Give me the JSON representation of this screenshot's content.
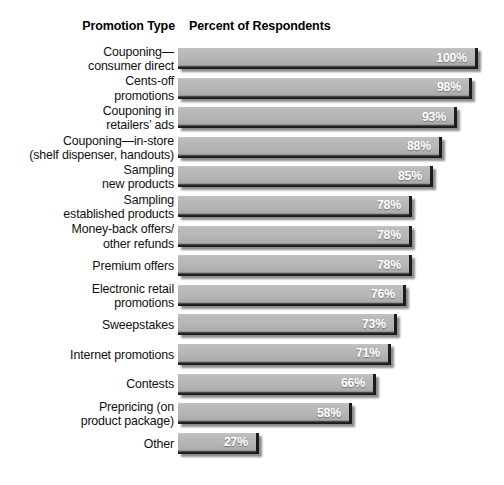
{
  "header": {
    "category_column": "Promotion Type",
    "value_column": "Percent of Respondents"
  },
  "watermark": "",
  "chart_data": {
    "type": "bar",
    "orientation": "horizontal",
    "title": "",
    "xlabel": "Percent of Respondents",
    "ylabel": "Promotion Type",
    "xlim": [
      0,
      100
    ],
    "grid": false,
    "legend": null,
    "value_suffix": "%",
    "bar_color": "#b4b4b4",
    "value_label_color": "#ffffff",
    "categories": [
      "Couponing—\nconsumer direct",
      "Cents-off\npromotions",
      "Couponing in\nretailers’ ads",
      "Couponing—in-store\n(shelf dispenser, handouts)",
      "Sampling\nnew products",
      "Sampling\nestablished products",
      "Money-back offers/\nother refunds",
      "Premium offers",
      "Electronic retail\npromotions",
      "Sweepstakes",
      "Internet promotions",
      "Contests",
      "Prepricing (on\nproduct package)",
      "Other"
    ],
    "values": [
      100,
      98,
      93,
      88,
      85,
      78,
      78,
      78,
      76,
      73,
      71,
      66,
      58,
      27
    ],
    "value_labels": [
      "100%",
      "98%",
      "93%",
      "88%",
      "85%",
      "78%",
      "78%",
      "78%",
      "76%",
      "73%",
      "71%",
      "66%",
      "58%",
      "27%"
    ]
  }
}
